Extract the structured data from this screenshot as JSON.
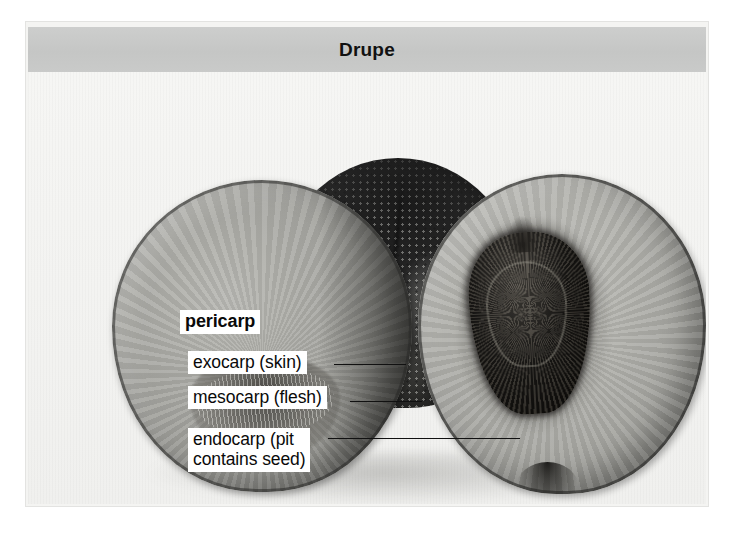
{
  "figure": {
    "title": "Drupe",
    "title_bar_color": "#c8c9c8",
    "frame_color": "#f4f4f2",
    "plate_background": "#f2f2f0"
  },
  "callouts": [
    {
      "id": "pericarp",
      "label": "pericarp",
      "bold": true,
      "has_leader": false
    },
    {
      "id": "exocarp",
      "label": "exocarp (skin)",
      "bold": false,
      "has_leader": true
    },
    {
      "id": "mesocarp",
      "label": "mesocarp (flesh)",
      "bold": false,
      "has_leader": true
    },
    {
      "id": "endocarp",
      "label": "endocarp (pit\ncontains seed)",
      "bold": false,
      "has_leader": true
    }
  ],
  "specimen": {
    "subject": "peach-drupe",
    "parts": [
      {
        "name": "whole-peach",
        "tone": "dark-mottled"
      },
      {
        "name": "left-half-cut-face",
        "tone": "mid-gray-flesh"
      },
      {
        "name": "right-half-cut-face",
        "tone": "light-gray-flesh"
      },
      {
        "name": "pit-endocarp",
        "tone": "very-dark"
      }
    ]
  }
}
